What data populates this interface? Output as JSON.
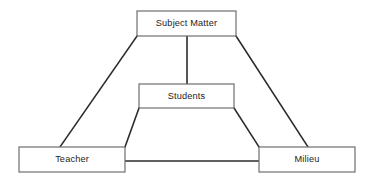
{
  "diagram": {
    "type": "node-link-diagram",
    "background_color": "#ffffff",
    "box_stroke_color": "#6e6e6e",
    "box_fill_color": "#ffffff",
    "connector_color": "#2b2b2b",
    "label_color": "#1c1c1c",
    "nodes": [
      {
        "id": "subject-matter",
        "label": "Subject Matter",
        "x": 137,
        "y": 11,
        "width": 99,
        "height": 25
      },
      {
        "id": "students",
        "label": "Students",
        "x": 139,
        "y": 84,
        "width": 95,
        "height": 24
      },
      {
        "id": "teacher",
        "label": "Teacher",
        "x": 19,
        "y": 147,
        "width": 106,
        "height": 25
      },
      {
        "id": "milieu",
        "label": "Milieu",
        "x": 259,
        "y": 147,
        "width": 96,
        "height": 25
      }
    ],
    "connectors": [
      {
        "id": "subject-to-teacher",
        "from": "subject-matter",
        "to": "teacher",
        "kind": "diagonal",
        "points": "137,36 60,147"
      },
      {
        "id": "subject-to-milieu",
        "from": "subject-matter",
        "to": "milieu",
        "kind": "diagonal",
        "points": "236,36 308,147"
      },
      {
        "id": "subject-to-students",
        "from": "subject-matter",
        "to": "students",
        "kind": "vertical",
        "points": "187,36 187,84"
      },
      {
        "id": "students-to-teacher",
        "from": "students",
        "to": "teacher",
        "kind": "diagonal",
        "points": "139,108 125,147"
      },
      {
        "id": "students-to-milieu",
        "from": "students",
        "to": "milieu",
        "kind": "diagonal",
        "points": "234,108 259,147"
      },
      {
        "id": "teacher-to-milieu",
        "from": "teacher",
        "to": "milieu",
        "kind": "horizontal",
        "points": "125,161 259,161"
      }
    ]
  }
}
